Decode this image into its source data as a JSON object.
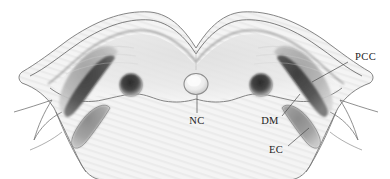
{
  "figure": {
    "type": "anatomical-cross-section",
    "modality": "grayscale-illustration",
    "background_color": "#ffffff",
    "outline_color": "#6e6e6e",
    "orientation": "axial-transverse-section",
    "labels": [
      {
        "id": "pcc",
        "text": "PCC",
        "meaning": "paracervical / paraspinal cartilage compartment",
        "text_x": 355,
        "text_y": 60,
        "anchor": "start",
        "leader_from_x": 348,
        "leader_from_y": 62,
        "leader_to_x": 312,
        "leader_to_y": 82,
        "side": "right"
      },
      {
        "id": "nc",
        "text": "NC",
        "meaning": "neural canal",
        "text_x": 197,
        "text_y": 122,
        "anchor": "middle",
        "leader_from_x": 197,
        "leader_from_y": 113,
        "leader_to_x": 197,
        "leader_to_y": 94,
        "side": "center"
      },
      {
        "id": "dm",
        "text": "DM",
        "meaning": "deep muscle",
        "text_x": 270,
        "text_y": 122,
        "anchor": "middle",
        "leader_from_x": 282,
        "leader_from_y": 116,
        "leader_to_x": 300,
        "leader_to_y": 94,
        "side": "right"
      },
      {
        "id": "ec",
        "text": "EC",
        "meaning": "epaxial compartment",
        "text_x": 276,
        "text_y": 151,
        "anchor": "middle",
        "leader_from_x": 288,
        "leader_from_y": 146,
        "leader_to_x": 309,
        "leader_to_y": 128,
        "side": "right"
      }
    ],
    "structures": [
      {
        "name": "body-outline",
        "fill": "#f2f2f2",
        "stroke": "#6e6e6e",
        "note": "double-humped dorsal silhouette with midline dip"
      },
      {
        "name": "left-large-muscle-pcc",
        "fill": "#b5b5b5",
        "cx": 88,
        "cy": 78
      },
      {
        "name": "right-large-muscle-pcc",
        "fill": "#b5b5b5",
        "cx": 302,
        "cy": 78
      },
      {
        "name": "left-dark-band-dm",
        "fill": "#555555",
        "cx": 82,
        "cy": 88
      },
      {
        "name": "right-dark-band-dm",
        "fill": "#555555",
        "cx": 308,
        "cy": 88
      },
      {
        "name": "left-lower-oval-ec",
        "fill": "#9a9a9a",
        "cx": 94,
        "cy": 126
      },
      {
        "name": "right-lower-oval-ec",
        "fill": "#9a9a9a",
        "cx": 296,
        "cy": 126
      },
      {
        "name": "left-dark-nodule",
        "fill": "#3d3d3d",
        "cx": 131,
        "cy": 85,
        "r": 11
      },
      {
        "name": "right-dark-nodule",
        "fill": "#3d3d3d",
        "cx": 261,
        "cy": 85,
        "r": 11
      },
      {
        "name": "midline-neural-canal",
        "fill": "#e8e8e8",
        "cx": 196,
        "cy": 84,
        "r": 11
      }
    ]
  }
}
